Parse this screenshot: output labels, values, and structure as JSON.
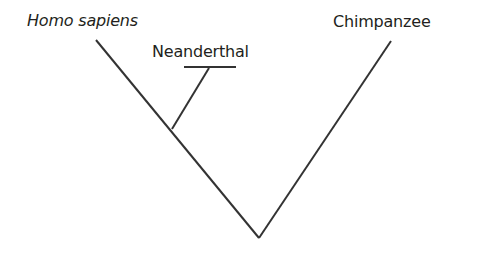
{
  "diagram": {
    "type": "phylogenetic-tree",
    "taxa": [
      {
        "id": "homo_sapiens",
        "label": "Homo sapiens",
        "italic": true
      },
      {
        "id": "neanderthal",
        "label": "Neanderthal",
        "italic": false
      },
      {
        "id": "chimpanzee",
        "label": "Chimpanzee",
        "italic": false
      }
    ],
    "line_color": "#333333",
    "text_color": "#231f20",
    "background": "#ffffff"
  }
}
